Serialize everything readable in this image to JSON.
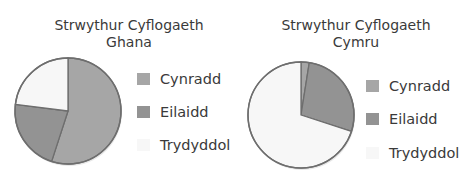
{
  "chart_data": [
    {
      "type": "pie",
      "title": "Strwythur Cyflogaeth Ghana",
      "title_lines": [
        "Strwythur Cyflogaeth",
        "Ghana"
      ],
      "categories": [
        "Cynradd",
        "Eilaidd",
        "Trydyddol"
      ],
      "values": [
        55,
        22,
        23
      ],
      "unit": "%",
      "colors": [
        "#a6a6a6",
        "#939393",
        "#f7f7f7"
      ],
      "start_angle_deg": 0,
      "direction": "clockwise",
      "legend_position": "right"
    },
    {
      "type": "pie",
      "title": "Strwythur Cyflogaeth Cymru",
      "title_lines": [
        "Strwythur Cyflogaeth",
        "Cymru"
      ],
      "categories": [
        "Cynradd",
        "Eilaidd",
        "Trydyddol"
      ],
      "values": [
        2.5,
        27.5,
        70
      ],
      "unit": "%",
      "colors": [
        "#a6a6a6",
        "#939393",
        "#f7f7f7"
      ],
      "start_angle_deg": 0,
      "direction": "clockwise",
      "legend_position": "right"
    }
  ],
  "style": {
    "outline": "#6e6e6e",
    "text": "#3a3a3a"
  }
}
